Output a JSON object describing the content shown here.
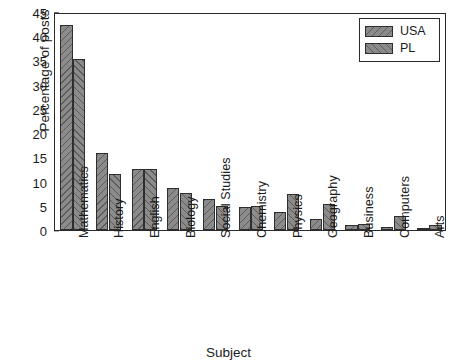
{
  "chart_data": {
    "type": "bar",
    "title": "",
    "xlabel": "Subject",
    "ylabel": "Percentage of posts",
    "ylim": [
      0,
      45
    ],
    "yticks": [
      0,
      5,
      10,
      15,
      20,
      25,
      30,
      35,
      40,
      45
    ],
    "grid": false,
    "legend_position": "top-right",
    "categories": [
      "Mathematics",
      "History",
      "English",
      "Biology",
      "Social Studies",
      "Chemistry",
      "Physics",
      "Geography",
      "Business",
      "Computers",
      "Arts"
    ],
    "series": [
      {
        "name": "USA",
        "values": [
          42.3,
          15.9,
          12.6,
          8.7,
          6.4,
          4.8,
          3.8,
          2.2,
          1.0,
          0.6,
          0.4
        ]
      },
      {
        "name": "PL",
        "values": [
          35.3,
          11.6,
          12.6,
          7.6,
          5.0,
          5.0,
          7.5,
          5.3,
          1.2,
          2.9,
          1.1
        ]
      }
    ]
  },
  "legend": {
    "entries": [
      {
        "label": "USA"
      },
      {
        "label": "PL"
      }
    ]
  },
  "colors": {
    "bar_fill": "#8b8b8b",
    "bar_edge": "#2e2e2e",
    "axis": "#2a2a2a",
    "text": "#1b1b1b",
    "background": "#ffffff"
  }
}
